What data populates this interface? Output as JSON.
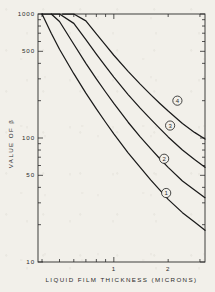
{
  "chart_data": {
    "type": "line",
    "title": "",
    "xlabel": "LIQUID FILM THICKNESS (MICRONS)",
    "ylabel": "VALUE OF β",
    "xscale": "log",
    "yscale": "log",
    "xlim": [
      0.38,
      3.2
    ],
    "ylim": [
      10,
      1000
    ],
    "grid": false,
    "legend_position": "inline-curve-labels",
    "x_tick_labels": [
      "1",
      "2"
    ],
    "x_tick_values": [
      1,
      2
    ],
    "y_tick_labels": [
      "1000",
      "500",
      "100",
      "50",
      "10"
    ],
    "y_tick_values": [
      1000,
      500,
      100,
      50,
      10
    ],
    "series": [
      {
        "name": "1",
        "label": "1",
        "x": [
          0.4,
          0.45,
          0.5,
          0.6,
          0.7,
          0.8,
          0.9,
          1.0,
          1.2,
          1.4,
          1.6,
          1.8,
          2.0,
          2.4,
          2.8,
          3.2
        ],
        "y": [
          1000,
          700,
          520,
          330,
          230,
          172,
          134,
          108,
          76,
          58,
          46,
          38,
          32,
          25,
          21,
          18
        ]
      },
      {
        "name": "2",
        "label": "2",
        "x": [
          0.4,
          0.45,
          0.5,
          0.6,
          0.7,
          0.8,
          0.9,
          1.0,
          1.2,
          1.4,
          1.6,
          1.8,
          2.0,
          2.4,
          2.8,
          3.2
        ],
        "y": [
          1000,
          1000,
          870,
          570,
          400,
          300,
          235,
          190,
          134,
          102,
          82,
          68,
          58,
          45,
          38,
          33
        ]
      },
      {
        "name": "3",
        "label": "3",
        "x": [
          0.45,
          0.5,
          0.6,
          0.7,
          0.8,
          0.9,
          1.0,
          1.2,
          1.4,
          1.6,
          1.8,
          2.0,
          2.4,
          2.8,
          3.2
        ],
        "y": [
          1000,
          1000,
          840,
          620,
          475,
          378,
          310,
          224,
          174,
          142,
          119,
          102,
          80,
          67,
          58
        ]
      },
      {
        "name": "4",
        "label": "4",
        "x": [
          0.52,
          0.6,
          0.7,
          0.8,
          0.9,
          1.0,
          1.2,
          1.4,
          1.6,
          1.8,
          2.0,
          2.4,
          2.8,
          3.2
        ],
        "y": [
          1000,
          1000,
          880,
          690,
          560,
          465,
          345,
          272,
          224,
          190,
          165,
          131,
          111,
          98
        ]
      }
    ],
    "curve_label_positions": [
      {
        "label": "1",
        "x": 1.95,
        "y": 36
      },
      {
        "label": "2",
        "x": 1.9,
        "y": 68
      },
      {
        "label": "3",
        "x": 2.05,
        "y": 126
      },
      {
        "label": "4",
        "x": 2.25,
        "y": 200
      }
    ],
    "colors": {
      "line": "#1a1a1a",
      "axis": "#2b2b2b",
      "background": "#f2f0ea",
      "text": "#2b2b2b"
    }
  }
}
